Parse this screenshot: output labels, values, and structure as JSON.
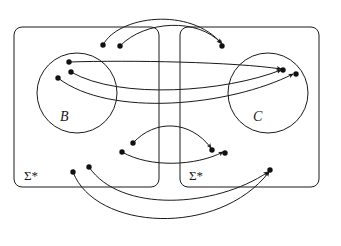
{
  "figure": {
    "name": "relation-diagram-sigma-star-B-C",
    "background": "#ffffff",
    "stroke_color": "#1a1a1a",
    "point_color": "#111111",
    "width": 341,
    "height": 246
  },
  "labels": {
    "set_b": "B",
    "set_c": "C",
    "sigma_left": "Σ*",
    "sigma_right": "Σ*"
  },
  "regions": [
    {
      "name": "outer-box-left",
      "label": "Σ*",
      "x": 14,
      "y": 27,
      "w": 145,
      "h": 160,
      "radius": 8
    },
    {
      "name": "outer-box-right",
      "label": "Σ*",
      "x": 180,
      "y": 27,
      "w": 139,
      "h": 160,
      "radius": 8
    },
    {
      "name": "circle-b",
      "label": "B",
      "cx": 77,
      "cy": 93,
      "r": 40
    },
    {
      "name": "circle-c",
      "label": "C",
      "cx": 268,
      "cy": 93,
      "r": 40
    }
  ],
  "points": [
    {
      "id": "p-top-src-1",
      "x": 103,
      "y": 45,
      "region": "outer-box-left"
    },
    {
      "id": "p-top-src-2",
      "x": 120,
      "y": 46,
      "region": "outer-box-left"
    },
    {
      "id": "p-top-tgt",
      "x": 222,
      "y": 46,
      "region": "outer-box-right"
    },
    {
      "id": "p-b-1",
      "x": 69,
      "y": 62,
      "region": "circle-b"
    },
    {
      "id": "p-b-2",
      "x": 71,
      "y": 72,
      "region": "circle-b"
    },
    {
      "id": "p-b-3",
      "x": 58,
      "y": 78,
      "region": "circle-b"
    },
    {
      "id": "p-c-1",
      "x": 283,
      "y": 70,
      "region": "circle-c"
    },
    {
      "id": "p-c-2",
      "x": 296,
      "y": 74,
      "region": "circle-c"
    },
    {
      "id": "p-mid-src-1",
      "x": 133,
      "y": 143,
      "region": "outer-box-left"
    },
    {
      "id": "p-mid-src-2",
      "x": 122,
      "y": 152,
      "region": "outer-box-left"
    },
    {
      "id": "p-mid-tgt-1",
      "x": 212,
      "y": 150,
      "region": "outer-box-right"
    },
    {
      "id": "p-mid-tgt-2",
      "x": 225,
      "y": 153,
      "region": "outer-box-right"
    },
    {
      "id": "p-low-src-1",
      "x": 89,
      "y": 167,
      "region": "outer-box-left"
    },
    {
      "id": "p-low-src-2",
      "x": 73,
      "y": 172,
      "region": "outer-box-left"
    },
    {
      "id": "p-low-tgt",
      "x": 270,
      "y": 170,
      "region": "outer-box-right"
    }
  ],
  "arrows": [
    {
      "id": "a-top-1",
      "from": "p-top-src-1",
      "to": "p-top-tgt",
      "path": "M103,45 C118,16 190,6 222,44"
    },
    {
      "id": "a-top-2",
      "from": "p-top-src-2",
      "to": "p-top-tgt",
      "path": "M120,46 C145,20 198,18 221,43"
    },
    {
      "id": "a-b1-c1",
      "from": "p-b-1",
      "to": "p-c-1",
      "path": "M69,62 C130,60 235,62 281,69"
    },
    {
      "id": "a-b2-c1",
      "from": "p-b-2",
      "to": "p-c-1",
      "path": "M71,72 C120,100 225,92 281,70"
    },
    {
      "id": "a-b3-c2",
      "from": "p-b-3",
      "to": "p-c-2",
      "path": "M58,78 C110,118 230,106 293,74"
    },
    {
      "id": "a-mid-1",
      "from": "p-mid-src-1",
      "to": "p-mid-tgt-1",
      "path": "M133,143 C155,119 190,120 211,148"
    },
    {
      "id": "a-mid-2",
      "from": "p-mid-src-2",
      "to": "p-mid-tgt-2",
      "path": "M122,152 C150,168 196,166 223,152"
    },
    {
      "id": "a-low-1",
      "from": "p-low-src-1",
      "to": "p-low-tgt",
      "path": "M89,167 C120,213 215,208 268,172"
    },
    {
      "id": "a-low-2",
      "from": "p-low-src-2",
      "to": "p-low-tgt",
      "path": "M73,172 C95,230 218,238 269,172"
    }
  ]
}
